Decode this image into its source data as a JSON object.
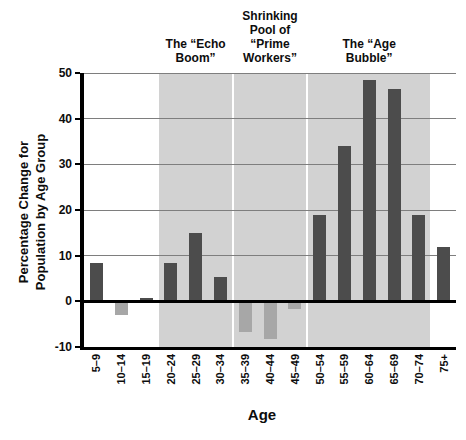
{
  "chart_data": {
    "type": "bar",
    "title": "",
    "xlabel": "Age",
    "ylabel": "Percentage Change for Population by Age Group",
    "ylabel_display": "Percentage Change for\nPopulation by Age Group",
    "categories": [
      "5–9",
      "10–14",
      "15–19",
      "20–24",
      "25–29",
      "30–34",
      "35–39",
      "40–44",
      "45–49",
      "50–54",
      "55–59",
      "60–64",
      "65–69",
      "70–74",
      "75+"
    ],
    "values": [
      8.3,
      -3,
      0.8,
      8.5,
      15,
      5.4,
      -6.8,
      -8.2,
      -1.6,
      19,
      34,
      48.5,
      46.5,
      19,
      11.8
    ],
    "ylim": [
      -10,
      50
    ],
    "yticks": [
      50,
      40,
      30,
      20,
      10,
      0,
      -10
    ],
    "grid": true,
    "legend": "none",
    "colors": {
      "positive_bar": "#4c4c4c",
      "negative_bar": "#a7a7a7",
      "region_fill": "#d2d2d2",
      "gridline": "#7e7e7e",
      "axis": "#000000",
      "background": "#ffffff"
    },
    "regions": [
      {
        "label": "The “Echo Boom”",
        "display_label": "The “Echo\nBoom”",
        "start_index": 3,
        "end_index": 5
      },
      {
        "label": "Shrinking Pool of “Prime Workers”",
        "display_label": "Shrinking\nPool of\n“Prime\nWorkers”",
        "start_index": 6,
        "end_index": 8
      },
      {
        "label": "The “Age Bubble”",
        "display_label": "The “Age\nBubble”",
        "start_index": 9,
        "end_index": 13
      }
    ]
  }
}
